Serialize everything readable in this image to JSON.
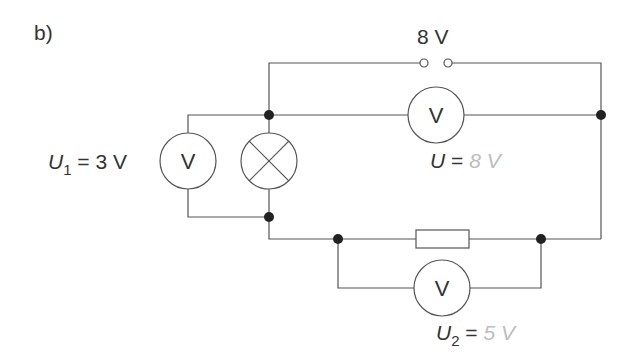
{
  "figure": {
    "part_label": "b)",
    "source_label": "8 V",
    "meter_symbol": "V",
    "readings": {
      "u1": {
        "symbol": "U",
        "subscript": "1",
        "equals": "=",
        "value": "3 V"
      },
      "u": {
        "symbol": "U",
        "subscript": "",
        "equals": "=",
        "value": "8 V"
      },
      "u2": {
        "symbol": "U",
        "subscript": "2",
        "equals": "=",
        "value": "5 V"
      }
    },
    "colors": {
      "line": "#444444",
      "text": "#333333",
      "answer": "#bdbdbd"
    }
  }
}
